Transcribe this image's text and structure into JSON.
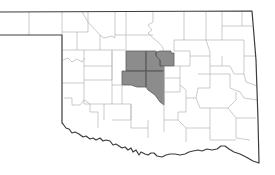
{
  "map": {
    "region": "Oklahoma",
    "subdivision": "counties",
    "colors": {
      "background": "#ffffff",
      "county_fill": "#ffffff",
      "county_border": "#b4b4b4",
      "state_border": "#3c3c3c",
      "highlight_fill": "#8c8c8c"
    },
    "highlighted_counties": [
      "Logan",
      "Canadian",
      "Oklahoma",
      "Grady",
      "Cleveland"
    ]
  }
}
